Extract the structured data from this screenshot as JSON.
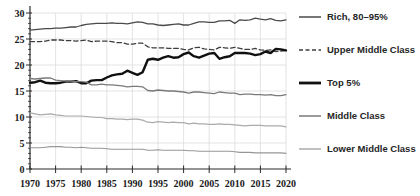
{
  "chart_data": {
    "type": "line",
    "title": "",
    "xlabel": "",
    "ylabel": "",
    "xlim": [
      1970,
      2020
    ],
    "ylim": [
      0,
      30
    ],
    "xticks": [
      1970,
      1975,
      1980,
      1985,
      1990,
      1995,
      2000,
      2005,
      2010,
      2015,
      2020
    ],
    "yticks": [
      0,
      5,
      10,
      15,
      20,
      25,
      30
    ],
    "grid": true,
    "gridline_color": "#dcdcdc",
    "axis_color": "#2b2b2b",
    "legend_position": "right",
    "x": [
      1970,
      1971,
      1972,
      1973,
      1974,
      1975,
      1976,
      1977,
      1978,
      1979,
      1980,
      1981,
      1982,
      1983,
      1984,
      1985,
      1986,
      1987,
      1988,
      1989,
      1990,
      1991,
      1992,
      1993,
      1994,
      1995,
      1996,
      1997,
      1998,
      1999,
      2000,
      2001,
      2002,
      2003,
      2004,
      2005,
      2006,
      2007,
      2008,
      2009,
      2010,
      2011,
      2012,
      2013,
      2014,
      2015,
      2016,
      2017,
      2018,
      2019,
      2020
    ],
    "series": [
      {
        "name": "Rich, 80–95%",
        "color": "#4a4a4a",
        "width": 1.3,
        "dash": false,
        "legend": true,
        "values": [
          26.7,
          26.8,
          26.9,
          27.0,
          27.0,
          27.1,
          27.1,
          27.2,
          27.3,
          27.3,
          27.6,
          27.8,
          27.9,
          28.0,
          28.0,
          28.0,
          28.1,
          28.0,
          28.0,
          27.9,
          28.1,
          28.3,
          28.2,
          27.9,
          27.9,
          27.7,
          27.6,
          27.7,
          27.8,
          27.9,
          27.7,
          27.7,
          28.0,
          28.3,
          28.3,
          28.2,
          28.2,
          28.5,
          28.5,
          28.6,
          28.0,
          28.7,
          28.6,
          28.7,
          29.0,
          28.8,
          28.7,
          28.9,
          28.6,
          28.5,
          28.7
        ]
      },
      {
        "name": "Upper Middle Class",
        "color": "#3d3d3d",
        "width": 1.3,
        "dash": true,
        "legend": true,
        "values": [
          24.5,
          24.5,
          24.5,
          24.6,
          24.8,
          24.8,
          24.8,
          24.7,
          24.7,
          24.6,
          24.7,
          24.8,
          24.5,
          24.6,
          24.6,
          24.6,
          24.5,
          24.3,
          24.3,
          24.0,
          24.0,
          24.2,
          24.2,
          23.5,
          23.3,
          23.3,
          23.3,
          23.2,
          23.2,
          23.2,
          23.0,
          22.9,
          23.3,
          23.4,
          23.1,
          23.0,
          22.9,
          23.4,
          23.3,
          23.2,
          23.4,
          23.2,
          23.0,
          23.0,
          23.2,
          22.9,
          22.8,
          22.9,
          22.6,
          22.7,
          22.8
        ]
      },
      {
        "name": "Top 5%",
        "color": "#111111",
        "width": 2.4,
        "dash": false,
        "legend": true,
        "values": [
          16.6,
          16.7,
          17.0,
          16.6,
          16.5,
          16.5,
          16.6,
          16.8,
          16.8,
          16.9,
          16.5,
          16.5,
          17.0,
          17.1,
          17.1,
          17.6,
          18.0,
          18.2,
          18.3,
          18.9,
          18.5,
          18.1,
          18.6,
          21.0,
          21.2,
          21.0,
          21.4,
          21.7,
          21.4,
          21.5,
          22.1,
          22.4,
          21.7,
          21.4,
          21.8,
          22.2,
          22.3,
          21.2,
          21.5,
          21.7,
          22.3,
          22.3,
          22.3,
          22.2,
          21.9,
          22.1,
          22.6,
          22.3,
          23.1,
          23.0,
          22.8
        ]
      },
      {
        "name": "Middle Class",
        "color": "#7a7a7a",
        "width": 1.3,
        "dash": false,
        "legend": true,
        "values": [
          17.4,
          17.3,
          17.4,
          17.5,
          17.5,
          17.1,
          17.0,
          16.9,
          16.9,
          16.8,
          16.8,
          16.7,
          16.2,
          16.2,
          16.3,
          16.2,
          16.2,
          16.1,
          16.0,
          15.8,
          15.9,
          15.9,
          15.8,
          15.1,
          15.0,
          15.2,
          15.1,
          15.0,
          15.0,
          14.9,
          14.8,
          14.6,
          14.8,
          14.8,
          14.7,
          14.6,
          14.5,
          14.8,
          14.7,
          14.6,
          14.6,
          14.3,
          14.4,
          14.4,
          14.3,
          14.3,
          14.2,
          14.3,
          14.1,
          14.1,
          14.3
        ]
      },
      {
        "name": "Lower Middle Class",
        "color": "#ababab",
        "width": 1.2,
        "dash": false,
        "legend": true,
        "values": [
          10.8,
          10.6,
          10.4,
          10.5,
          10.6,
          10.4,
          10.3,
          10.2,
          10.2,
          10.2,
          10.2,
          10.1,
          10.0,
          9.9,
          9.9,
          9.7,
          9.7,
          9.6,
          9.6,
          9.5,
          9.6,
          9.6,
          9.4,
          9.0,
          8.9,
          9.1,
          9.0,
          8.9,
          9.0,
          8.9,
          8.9,
          8.7,
          8.8,
          8.7,
          8.7,
          8.6,
          8.6,
          8.7,
          8.6,
          8.6,
          8.5,
          8.4,
          8.3,
          8.4,
          8.4,
          8.4,
          8.3,
          8.3,
          8.3,
          8.3,
          8.1
        ]
      },
      {
        "name": "",
        "color": "#969696",
        "width": 1.1,
        "dash": false,
        "legend": false,
        "values": [
          4.1,
          4.1,
          4.1,
          4.2,
          4.3,
          4.3,
          4.3,
          4.2,
          4.2,
          4.1,
          4.2,
          4.1,
          4.0,
          4.0,
          4.0,
          3.9,
          3.8,
          3.8,
          3.8,
          3.8,
          3.8,
          3.8,
          3.8,
          3.6,
          3.6,
          3.7,
          3.6,
          3.6,
          3.6,
          3.6,
          3.6,
          3.5,
          3.5,
          3.4,
          3.4,
          3.4,
          3.4,
          3.4,
          3.4,
          3.4,
          3.3,
          3.2,
          3.2,
          3.2,
          3.1,
          3.1,
          3.1,
          3.1,
          3.1,
          3.1,
          3.0
        ]
      }
    ]
  }
}
